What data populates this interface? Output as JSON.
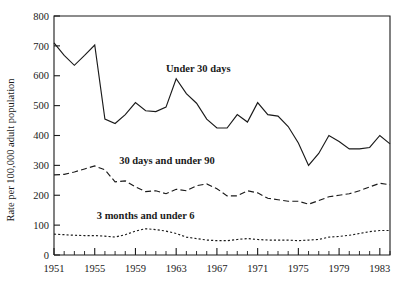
{
  "chart_data": {
    "type": "line",
    "title": "",
    "xlabel": "",
    "ylabel": "Rate per 100,000 adult population",
    "xlim": [
      1951,
      1984
    ],
    "ylim": [
      0,
      800
    ],
    "ytick_labels": [
      "0",
      "100",
      "200",
      "300",
      "400",
      "500",
      "600",
      "700",
      "800"
    ],
    "ytick_values": [
      0,
      100,
      200,
      300,
      400,
      500,
      600,
      700,
      800
    ],
    "xtick_labels": [
      "1951",
      "1955",
      "1959",
      "1963",
      "1967",
      "1971",
      "1975",
      "1979",
      "1983"
    ],
    "xtick_values": [
      1951,
      1955,
      1959,
      1963,
      1967,
      1971,
      1975,
      1979,
      1983
    ],
    "minor_xticks_every": 1,
    "grid": false,
    "legend_position": "inline-annotations",
    "x": [
      1951,
      1952,
      1953,
      1954,
      1955,
      1956,
      1957,
      1958,
      1959,
      1960,
      1961,
      1962,
      1963,
      1964,
      1965,
      1966,
      1967,
      1968,
      1969,
      1970,
      1971,
      1972,
      1973,
      1974,
      1975,
      1976,
      1977,
      1978,
      1979,
      1980,
      1981,
      1982,
      1983,
      1984
    ],
    "series": [
      {
        "name": "Under 30 days",
        "style": "solid",
        "annotation": "Under 30 days",
        "values": [
          710,
          668,
          635,
          668,
          703,
          455,
          440,
          470,
          510,
          483,
          480,
          495,
          590,
          540,
          508,
          455,
          425,
          425,
          470,
          445,
          510,
          470,
          465,
          430,
          375,
          300,
          340,
          400,
          380,
          355,
          355,
          360,
          400,
          372
        ]
      },
      {
        "name": "30 days and under 90",
        "style": "dashed",
        "annotation": "30 days and under 90",
        "values": [
          268,
          270,
          278,
          288,
          298,
          285,
          245,
          248,
          228,
          212,
          215,
          205,
          220,
          215,
          232,
          238,
          222,
          198,
          198,
          215,
          208,
          190,
          185,
          180,
          180,
          170,
          182,
          195,
          200,
          205,
          215,
          228,
          240,
          235
        ]
      },
      {
        "name": "3 months and under 6",
        "style": "dotted",
        "annotation": "3 months and under 6",
        "values": [
          70,
          68,
          66,
          65,
          65,
          63,
          60,
          68,
          80,
          88,
          85,
          80,
          72,
          60,
          55,
          50,
          48,
          48,
          52,
          55,
          52,
          50,
          50,
          50,
          48,
          50,
          52,
          60,
          62,
          66,
          72,
          78,
          82,
          82
        ]
      }
    ],
    "annotations": [
      {
        "text": "Under 30 days",
        "x": 1962.0,
        "y": 612
      },
      {
        "text": "30 days and under 90",
        "x": 1957.4,
        "y": 305
      },
      {
        "text": "3 months and under 6",
        "x": 1955.2,
        "y": 122
      }
    ],
    "colors": {
      "axis": "#1a1a1a",
      "series": "#1a1a1a",
      "background": "#ffffff"
    }
  }
}
